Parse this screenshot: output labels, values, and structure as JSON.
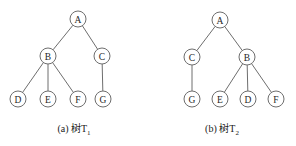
{
  "figure": {
    "background_color": "#ffffff",
    "stroke_color": "#6e6e6e",
    "text_color": "#262626",
    "node_radius": 8
  },
  "trees": [
    {
      "id": "tree-1",
      "caption_prefix": "(a) 树T",
      "caption_subscript": "1",
      "caption_full": "(a) 树T1",
      "nodes": [
        {
          "id": "A",
          "label": "A",
          "x": 78,
          "y": 19
        },
        {
          "id": "B",
          "label": "B",
          "x": 48,
          "y": 56
        },
        {
          "id": "C",
          "label": "C",
          "x": 102,
          "y": 56
        },
        {
          "id": "D",
          "label": "D",
          "x": 18,
          "y": 99
        },
        {
          "id": "E",
          "label": "E",
          "x": 48,
          "y": 99
        },
        {
          "id": "F",
          "label": "F",
          "x": 78,
          "y": 99
        },
        {
          "id": "G",
          "label": "G",
          "x": 103,
          "y": 99
        }
      ],
      "edges": [
        {
          "from": "A",
          "to": "B"
        },
        {
          "from": "A",
          "to": "C"
        },
        {
          "from": "B",
          "to": "D"
        },
        {
          "from": "B",
          "to": "E"
        },
        {
          "from": "B",
          "to": "F"
        },
        {
          "from": "C",
          "to": "G"
        }
      ]
    },
    {
      "id": "tree-2",
      "caption_prefix": "(b) 树T",
      "caption_subscript": "2",
      "caption_full": "(b) 树T2",
      "nodes": [
        {
          "id": "A",
          "label": "A",
          "x": 72,
          "y": 20
        },
        {
          "id": "C",
          "label": "C",
          "x": 44,
          "y": 57
        },
        {
          "id": "B",
          "label": "B",
          "x": 99,
          "y": 57
        },
        {
          "id": "G",
          "label": "G",
          "x": 44,
          "y": 99
        },
        {
          "id": "E",
          "label": "E",
          "x": 72,
          "y": 99
        },
        {
          "id": "D",
          "label": "D",
          "x": 100,
          "y": 99
        },
        {
          "id": "F",
          "label": "F",
          "x": 128,
          "y": 99
        }
      ],
      "edges": [
        {
          "from": "A",
          "to": "C"
        },
        {
          "from": "A",
          "to": "B"
        },
        {
          "from": "C",
          "to": "G"
        },
        {
          "from": "B",
          "to": "E"
        },
        {
          "from": "B",
          "to": "D"
        },
        {
          "from": "B",
          "to": "F"
        }
      ]
    }
  ]
}
